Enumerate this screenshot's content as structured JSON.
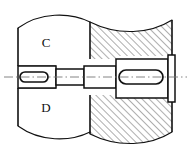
{
  "drawing": {
    "title": "Sectional assembly drawing of keyed stepped shaft in housing",
    "canvas": {
      "width": 191,
      "height": 154
    },
    "background_color": "#ffffff",
    "line_color": "#111111",
    "hatch_color": "#333333",
    "labels": [
      {
        "id": "label-c",
        "text": "C",
        "x": 46,
        "y": 47
      },
      {
        "id": "label-d",
        "text": "D",
        "x": 46,
        "y": 112
      }
    ],
    "regions": {
      "left_part": {
        "name": "C",
        "second_name": "D",
        "filled": "none",
        "x": 18,
        "y": 18,
        "width": 72,
        "height": 118
      },
      "right_part": {
        "name": "section-hatched-housing",
        "filled": "diagonal-hatch",
        "hatch_angle_deg": 45,
        "hatch_spacing_px": 5,
        "x": 90,
        "y": 14,
        "width": 82,
        "height": 124
      }
    },
    "shaft": {
      "name": "stepped-shaft",
      "centerline_y": 77,
      "steps": [
        {
          "id": "step-1",
          "x0": 18,
          "x1": 56,
          "half_height": 11
        },
        {
          "id": "step-2",
          "x0": 56,
          "x1": 84,
          "half_height": 8
        },
        {
          "id": "step-3",
          "x0": 84,
          "x1": 116,
          "half_height": 11
        },
        {
          "id": "step-4",
          "x0": 116,
          "x1": 168,
          "half_height": 18
        },
        {
          "id": "step-5-collar",
          "x0": 168,
          "x1": 174,
          "half_height": 22
        }
      ]
    },
    "keyways": [
      {
        "id": "keyway-left",
        "cx": 33,
        "cy": 77,
        "rx": 14,
        "ry": 5
      },
      {
        "id": "keyway-right",
        "cx": 140,
        "cy": 77,
        "rx": 22,
        "ry": 7
      }
    ],
    "break_lines": {
      "top_left": "convex-arc",
      "top_right": "concave-arc",
      "bottom_left": "convex-arc",
      "bottom_right": "concave-arc"
    },
    "centerline": {
      "name": "axis-centerline",
      "style": "dash-dot",
      "x0": 4,
      "x1": 187,
      "y": 77
    }
  }
}
